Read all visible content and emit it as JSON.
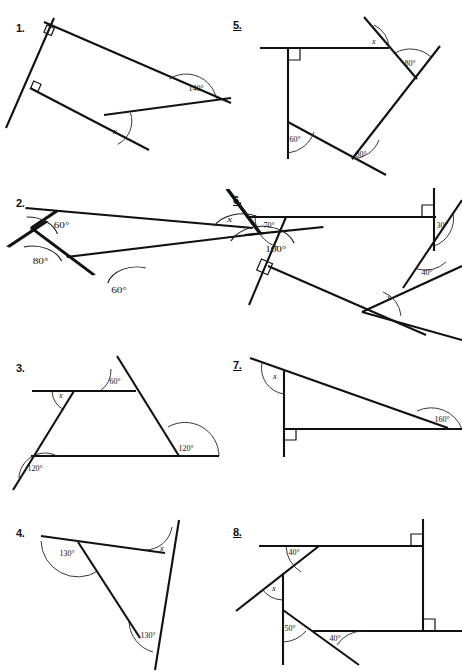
{
  "document": {
    "title": "Angles in Polygons Worksheet",
    "page_width": 462,
    "page_height": 672,
    "background": "#ffffff",
    "ink_color": "#111111"
  },
  "problems": [
    {
      "id": "problem-1",
      "number": "1.",
      "underlined": false,
      "num_pos": [
        16,
        22
      ],
      "angle_labels": [
        {
          "text": "140°",
          "x": 196,
          "y": 91
        },
        {
          "text": "x",
          "x": 117,
          "y": 134
        }
      ],
      "unknown": "x",
      "known_angles": [
        "140°"
      ],
      "right_angles": 2
    },
    {
      "id": "problem-2",
      "number": "2.",
      "underlined": false,
      "num_pos": [
        16,
        197
      ],
      "angle_labels": [
        {
          "text": "60°",
          "x": 44,
          "y": 225
        },
        {
          "text": "80°",
          "x": 29,
          "y": 262
        },
        {
          "text": "60°",
          "x": 85,
          "y": 293
        },
        {
          "text": "100°",
          "x": 197,
          "y": 252
        },
        {
          "text": "x",
          "x": 164,
          "y": 222
        }
      ],
      "unknown": "x",
      "known_angles": [
        "60°",
        "80°",
        "60°",
        "100°"
      ],
      "right_angles": 0
    },
    {
      "id": "problem-3",
      "number": "3.",
      "underlined": false,
      "num_pos": [
        16,
        367
      ],
      "angle_labels": [
        {
          "text": "60°",
          "x": 115,
          "y": 384
        },
        {
          "text": "x",
          "x": 62,
          "y": 394
        },
        {
          "text": "120°",
          "x": 185,
          "y": 450
        },
        {
          "text": "120°",
          "x": 34,
          "y": 470
        }
      ],
      "unknown": "x",
      "known_angles": [
        "60°",
        "120°",
        "120°"
      ],
      "right_angles": 0
    },
    {
      "id": "problem-4",
      "number": "4.",
      "underlined": false,
      "num_pos": [
        16,
        530
      ],
      "angle_labels": [
        {
          "text": "130°",
          "x": 62,
          "y": 553
        },
        {
          "text": "x",
          "x": 162,
          "y": 549
        },
        {
          "text": "130°",
          "x": 146,
          "y": 634
        }
      ],
      "unknown": "x",
      "known_angles": [
        "130°",
        "130°"
      ],
      "right_angles": 0
    },
    {
      "id": "problem-5",
      "number": "5.",
      "underlined": true,
      "num_pos": [
        233,
        22
      ],
      "angle_labels": [
        {
          "text": "x",
          "x": 373,
          "y": 45
        },
        {
          "text": "80°",
          "x": 409,
          "y": 66
        },
        {
          "text": "60°",
          "x": 294,
          "y": 142
        },
        {
          "text": "80°",
          "x": 360,
          "y": 157
        }
      ],
      "unknown": "x",
      "known_angles": [
        "80°",
        "60°",
        "80°"
      ],
      "right_angles": 1
    },
    {
      "id": "problem-6",
      "number": "6.",
      "underlined": true,
      "num_pos": [
        233,
        197
      ],
      "angle_labels": [
        {
          "text": "70°",
          "x": 269,
          "y": 228
        },
        {
          "text": "30°",
          "x": 432,
          "y": 228
        },
        {
          "text": "40°",
          "x": 424,
          "y": 275
        },
        {
          "text": "x",
          "x": 389,
          "y": 300
        }
      ],
      "unknown": "x",
      "known_angles": [
        "70°",
        "30°",
        "40°"
      ],
      "right_angles": 2
    },
    {
      "id": "problem-7",
      "number": "7.",
      "underlined": true,
      "num_pos": [
        233,
        367
      ],
      "angle_labels": [
        {
          "text": "x",
          "x": 275,
          "y": 379
        },
        {
          "text": "160°",
          "x": 438,
          "y": 419
        }
      ],
      "unknown": "x",
      "known_angles": [
        "160°"
      ],
      "right_angles": 1
    },
    {
      "id": "problem-8",
      "number": "8.",
      "underlined": true,
      "num_pos": [
        233,
        532
      ],
      "angle_labels": [
        {
          "text": "40°",
          "x": 292,
          "y": 552
        },
        {
          "text": "x",
          "x": 274,
          "y": 589
        },
        {
          "text": "50°",
          "x": 285,
          "y": 628
        },
        {
          "text": "40°",
          "x": 333,
          "y": 640
        }
      ],
      "unknown": "x",
      "known_angles": [
        "40°",
        "50°",
        "40°"
      ],
      "right_angles": 2
    }
  ]
}
